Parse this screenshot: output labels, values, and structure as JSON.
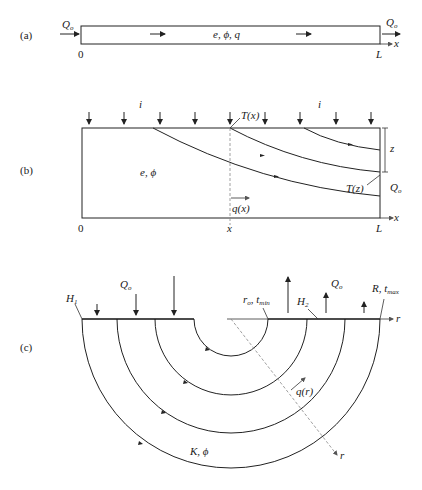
{
  "panels": {
    "a": {
      "label": "(a)",
      "inflow": "Q",
      "inflow_sub": "o",
      "outflow": "Q",
      "outflow_sub": "o",
      "center": "e, ϕ, q",
      "x_start": "0",
      "x_end": "L",
      "axis": "x"
    },
    "b": {
      "label": "(b)",
      "recharge_left": "i",
      "recharge_right": "i",
      "tx": "T(x)",
      "tz": "T(z)",
      "medium": "e, ϕ",
      "flux": "q(x)",
      "depth": "z",
      "outflow": "Q",
      "outflow_sub": "o",
      "x_start": "0",
      "x_mid": "x",
      "x_end": "L",
      "axis": "x"
    },
    "c": {
      "label": "(c)",
      "h1": "H",
      "h1_sub": "1",
      "h2": "H",
      "h2_sub": "2",
      "q_left": "Q",
      "q_left_sub": "o",
      "q_right": "Q",
      "q_right_sub": "o",
      "inner": "r",
      "inner_sub": "o",
      "inner_t": ", t",
      "inner_t_sub": "min",
      "outer": "R, t",
      "outer_sub": "max",
      "flux": "q(r)",
      "medium": "K, ϕ",
      "axis_h": "r",
      "axis_d": "r"
    }
  }
}
